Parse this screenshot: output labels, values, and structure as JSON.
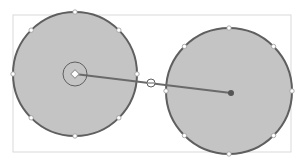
{
  "canvas": {
    "width": 303,
    "height": 163,
    "background": "#ffffff"
  },
  "colors": {
    "frame": "#d9d9d9",
    "circle_fill": "#c4c4c4",
    "circle_stroke": "#5f5f5f",
    "connector": "#6a6a6a",
    "handle_fill": "#ffffff",
    "handle_stroke": "#9a9a9a",
    "end_dot": "#555555"
  },
  "frame": {
    "x": 13,
    "y": 15,
    "width": 278,
    "height": 137
  },
  "shapes": [
    {
      "id": "circle-left",
      "cx": 75,
      "cy": 74,
      "r": 62
    },
    {
      "id": "circle-right",
      "cx": 229,
      "cy": 91,
      "r": 63
    }
  ],
  "connector": {
    "x1": 75,
    "y1": 74,
    "x2": 231,
    "y2": 93,
    "midpoint": {
      "x": 151,
      "y": 83
    }
  },
  "anchor_ring": {
    "cx": 75,
    "cy": 74,
    "r": 12
  }
}
